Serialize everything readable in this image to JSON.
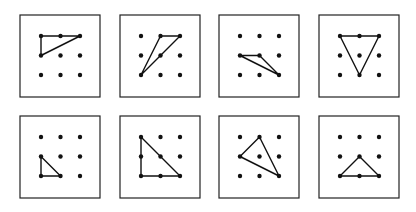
{
  "colors": {
    "ink": "#111111",
    "frame": "#222222",
    "background": "#ffffff"
  },
  "layout": {
    "box_size": 80,
    "box_height": 82,
    "dot_spacing": 19.5,
    "dot_offset": 21,
    "dot_radius": 2.2,
    "columns_x": [
      20,
      120,
      219,
      319
    ],
    "rows_y": [
      15,
      116
    ]
  },
  "panels": [
    {
      "id": 1,
      "row": 0,
      "col": 0,
      "triangle": [
        [
          0,
          0
        ],
        [
          2,
          0
        ],
        [
          0,
          1
        ]
      ]
    },
    {
      "id": 2,
      "row": 0,
      "col": 1,
      "triangle": [
        [
          1,
          0
        ],
        [
          2,
          0
        ],
        [
          0,
          2
        ]
      ]
    },
    {
      "id": 3,
      "row": 0,
      "col": 2,
      "triangle": [
        [
          0,
          1
        ],
        [
          1,
          1
        ],
        [
          2,
          2
        ]
      ]
    },
    {
      "id": 4,
      "row": 0,
      "col": 3,
      "triangle": [
        [
          0,
          0
        ],
        [
          2,
          0
        ],
        [
          1,
          2
        ]
      ]
    },
    {
      "id": 5,
      "row": 1,
      "col": 0,
      "triangle": [
        [
          0,
          1
        ],
        [
          0,
          2
        ],
        [
          1,
          2
        ]
      ]
    },
    {
      "id": 6,
      "row": 1,
      "col": 1,
      "triangle": [
        [
          0,
          0
        ],
        [
          0,
          2
        ],
        [
          2,
          2
        ]
      ]
    },
    {
      "id": 7,
      "row": 1,
      "col": 2,
      "triangle": [
        [
          1,
          0
        ],
        [
          0,
          1
        ],
        [
          2,
          2
        ]
      ]
    },
    {
      "id": 8,
      "row": 1,
      "col": 3,
      "triangle": [
        [
          1,
          1
        ],
        [
          0,
          2
        ],
        [
          2,
          2
        ]
      ]
    }
  ]
}
